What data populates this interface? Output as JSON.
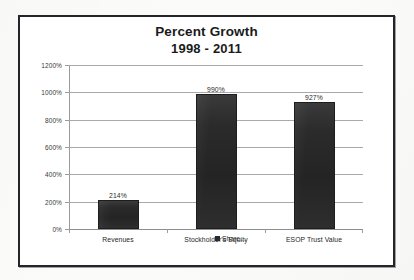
{
  "chart_data": {
    "type": "bar",
    "title": "Percent Growth",
    "subtitle": "1998 - 2011",
    "categories": [
      "Revenues",
      "Stockholder's Equity",
      "ESOP Trust Value"
    ],
    "values": [
      214,
      990,
      927
    ],
    "value_labels": [
      "214%",
      "990%",
      "927%"
    ],
    "xlabel": "",
    "ylabel": "",
    "ylim": [
      0,
      1200
    ],
    "ytick_values": [
      0,
      200,
      400,
      600,
      800,
      1000,
      1200
    ],
    "ytick_labels": [
      "0%",
      "200%",
      "400%",
      "600%",
      "800%",
      "1000%",
      "1200%"
    ],
    "grid": true,
    "legend": {
      "position": "bottom",
      "entries": [
        {
          "label": "Share...",
          "color": "#2a2a2a"
        }
      ]
    },
    "series": [
      {
        "name": "Share...",
        "color": "#2a2a2a",
        "values": [
          214,
          990,
          927
        ]
      }
    ]
  },
  "colors": {
    "bar": "#2a2a2a",
    "gridline": "#a9a9a9",
    "axis": "#9b9b9b",
    "frame": "#24242a",
    "text": "#1b1b1b",
    "background": "#ffffff"
  }
}
